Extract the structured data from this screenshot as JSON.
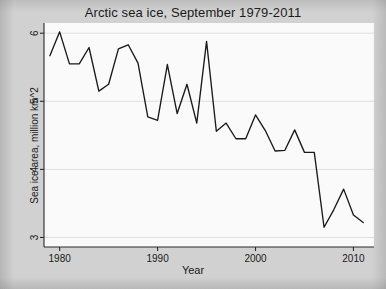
{
  "chart_data": {
    "type": "line",
    "title": "Arctic sea ice, September 1979-2011",
    "xlabel": "Year",
    "ylabel": "Sea ice area, million km^2",
    "xlim": [
      1978.4,
      2012.1
    ],
    "ylim": [
      2.86,
      6.15
    ],
    "grid": true,
    "grid_axis": "y",
    "legend": null,
    "xticks": [
      1980,
      1990,
      2000,
      2010
    ],
    "xtick_labels": [
      "1980",
      "1990",
      "2000",
      "2010"
    ],
    "yticks": [
      3,
      4,
      5,
      6
    ],
    "ytick_labels": [
      "3",
      "4",
      "5",
      "6"
    ],
    "x": [
      1979,
      1980,
      1981,
      1982,
      1983,
      1984,
      1985,
      1986,
      1987,
      1988,
      1989,
      1990,
      1991,
      1992,
      1993,
      1994,
      1995,
      1996,
      1997,
      1998,
      1999,
      2000,
      2001,
      2002,
      2003,
      2004,
      2005,
      2006,
      2007,
      2008,
      2009,
      2010,
      2011
    ],
    "values": [
      5.67,
      6.02,
      5.55,
      5.55,
      5.79,
      5.15,
      5.25,
      5.77,
      5.83,
      5.56,
      4.77,
      4.72,
      5.54,
      4.82,
      5.25,
      4.68,
      5.88,
      4.56,
      4.68,
      4.45,
      4.45,
      4.8,
      4.57,
      4.27,
      4.28,
      4.58,
      4.25,
      4.25,
      3.15,
      3.41,
      3.71,
      3.33,
      3.22
    ],
    "series_name": "September Arctic sea ice area",
    "line_color": "#1a1a1a",
    "plot_bg": "#fdfdfd",
    "figure_bg": "#d4d4d4"
  },
  "axes": {
    "title": "Arctic sea ice, September 1979-2011",
    "xlabel": "Year",
    "ylabel": "Sea ice area, million km^2"
  }
}
